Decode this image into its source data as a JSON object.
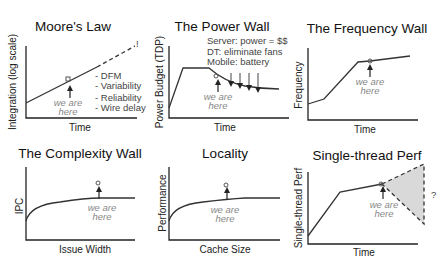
{
  "panels": [
    {
      "id": "moores-law",
      "title": "Moore's Law",
      "ylabel": "Integration (log scale)",
      "xlabel": "Time",
      "marker_label": [
        "we are",
        "here"
      ],
      "notes": [
        "- DFM",
        "- Variability",
        "- Reliability",
        "- Wire delay"
      ],
      "exclamation": "!"
    },
    {
      "id": "power-wall",
      "title": "The Power Wall",
      "ylabel": "Power Budget (TDP)",
      "xlabel": "Time",
      "marker_label": [
        "we are",
        "here"
      ],
      "notes": [
        "Server: power = $$",
        "DT: eliminate fans",
        "Mobile: battery"
      ]
    },
    {
      "id": "frequency-wall",
      "title": "The Frequency Wall",
      "ylabel": "Frequency",
      "xlabel": "Time",
      "marker_label": [
        "we are",
        "here"
      ]
    },
    {
      "id": "complexity-wall",
      "title": "The Complexity Wall",
      "ylabel": "IPC",
      "xlabel": "Issue Width",
      "marker_label": [
        "we are",
        "here"
      ]
    },
    {
      "id": "locality",
      "title": "Locality",
      "ylabel": "Performance",
      "xlabel": "Cache Size",
      "marker_label": [
        "we are",
        "here"
      ]
    },
    {
      "id": "single-thread-perf",
      "title": "Single-thread Perf",
      "ylabel": "Single-thread Perf",
      "xlabel": "Time",
      "marker_label": [
        "we are",
        "here"
      ],
      "uncertainty": "?"
    }
  ],
  "colors": {
    "line": "#333333",
    "marker_text": "#888888",
    "shade": "#d9d9d9"
  }
}
